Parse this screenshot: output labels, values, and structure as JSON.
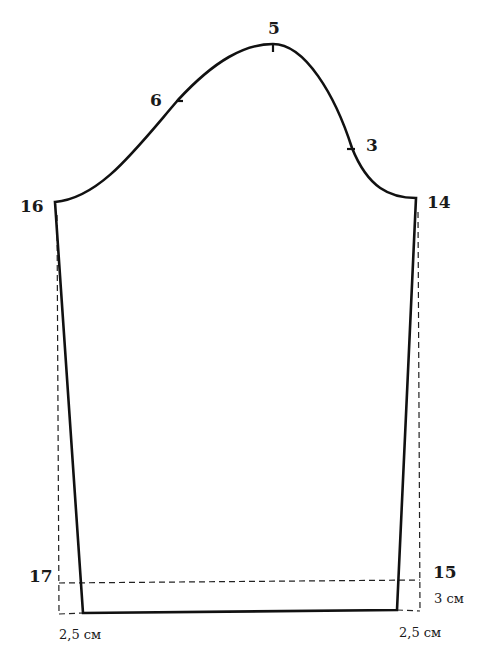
{
  "diagram": {
    "points": {
      "p5": "5",
      "p6": "6",
      "p3": "3",
      "p16": "16",
      "p14": "14",
      "p17": "17",
      "p15": "15"
    },
    "measurements": {
      "hem_allowance": "3 см",
      "left_taper": "2,5 см",
      "right_taper": "2,5 см"
    },
    "colors": {
      "line": "#111111",
      "background": "#ffffff"
    }
  }
}
